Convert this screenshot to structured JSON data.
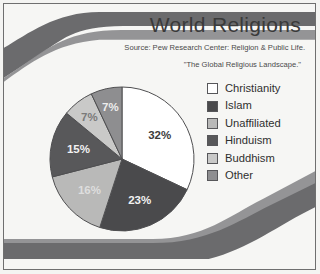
{
  "slide": {
    "title": "World Religions",
    "source_line_1": "Source: Pew Research Center: Religion & Public Life.",
    "source_line_2": "\"The Global Religious Landscape.\"",
    "background_color": "#f6f6f4",
    "frame_color": "#6f6f6f",
    "wave_color_dark": "#6b6b6d",
    "wave_color_light": "#8e8e90"
  },
  "chart_data": {
    "type": "pie",
    "title": "World Religions",
    "subtitle": "Source: Pew Research Center: Religion & Public Life. \"The Global Religious Landscape.\"",
    "legend_position": "right",
    "grid": false,
    "xlabel": "",
    "ylabel": "",
    "categories": [
      "Christianity",
      "Islam",
      "Unaffiliated",
      "Hinduism",
      "Buddhism",
      "Other"
    ],
    "values": [
      32,
      23,
      16,
      15,
      7,
      7
    ],
    "value_labels": [
      "32%",
      "23%",
      "16%",
      "15%",
      "7%",
      "7%"
    ],
    "colors": [
      "#ffffff",
      "#4a4a4c",
      "#b9b9b8",
      "#58585a",
      "#c9c9c8",
      "#8e8e90"
    ],
    "label_text_colors": [
      "#3c3c3c",
      "#f2f2f2",
      "#dedede",
      "#f2f2f2",
      "#7a7a7a",
      "#ededed"
    ],
    "slice_outline_color": "#4f4f51",
    "start_angle_deg": 0,
    "direction": "clockwise",
    "units": "percent"
  },
  "legend": {
    "items": [
      {
        "label": "Christianity",
        "swatch": "#ffffff"
      },
      {
        "label": "Islam",
        "swatch": "#4a4a4c"
      },
      {
        "label": "Unaffiliated",
        "swatch": "#b9b9b8"
      },
      {
        "label": "Hinduism",
        "swatch": "#58585a"
      },
      {
        "label": "Buddhism",
        "swatch": "#c9c9c8"
      },
      {
        "label": "Other",
        "swatch": "#8e8e90"
      }
    ]
  }
}
